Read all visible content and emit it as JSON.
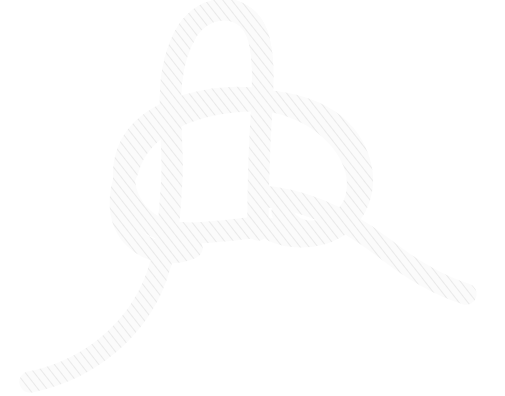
{
  "image": {
    "title": "Rope knot line drawing",
    "subject": "bowline-style knot",
    "width": 505,
    "height": 396,
    "background_color": "#ffffff",
    "style": "black-and-white line illustration"
  },
  "rope": {
    "outline_color": "#0d0d0d",
    "fill_color": "#fafafa",
    "hatch_color": "#e8e8e8",
    "band_width": 19,
    "outline_width": 2.6,
    "end_cap": "round"
  },
  "segments": [
    {
      "name": "standing-part-bottom-left",
      "description": "Rope tail exiting the drawing at the lower-left edge"
    },
    {
      "name": "upper-bight-loop",
      "description": "Tall narrow loop rising to the top of the frame"
    },
    {
      "name": "left-outer-curve",
      "description": "Wide curve sweeping down the left side of the knot"
    },
    {
      "name": "horizontal-collar",
      "description": "Band crossing horizontally through the middle of the knot"
    },
    {
      "name": "right-outer-arc",
      "description": "Large arc sweeping over and down on the right side"
    },
    {
      "name": "working-end-tail",
      "description": "Free end exiting to the lower right with a rounded tip"
    }
  ],
  "crossings": [
    {
      "name": "crossing-upper-left",
      "x": 150,
      "y": 112,
      "over": "horizontal-collar"
    },
    {
      "name": "crossing-upper-right",
      "x": 258,
      "y": 104,
      "over": "right-outer-arc"
    },
    {
      "name": "crossing-mid-left",
      "x": 168,
      "y": 196,
      "over": "left-outer-curve"
    },
    {
      "name": "crossing-mid-right",
      "x": 295,
      "y": 196,
      "over": "working-end-tail"
    },
    {
      "name": "crossing-lower-right",
      "x": 330,
      "y": 222,
      "over": "working-end-tail"
    }
  ]
}
